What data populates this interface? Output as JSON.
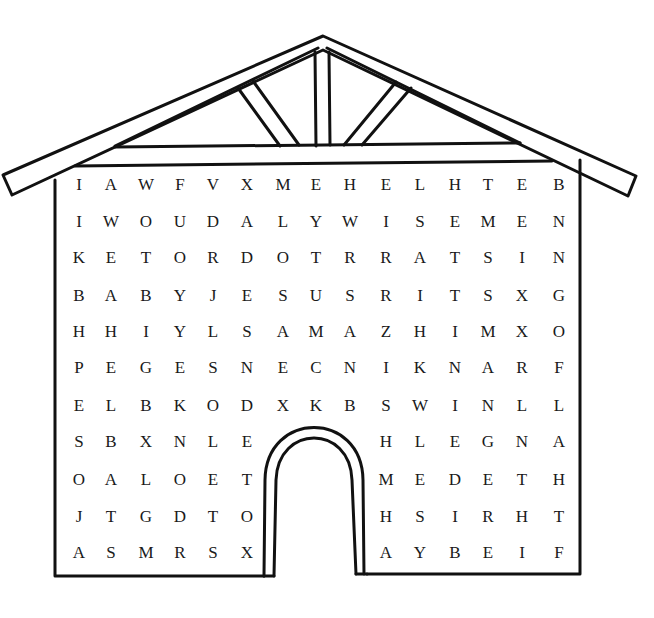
{
  "puzzle": {
    "type": "word-search",
    "shape": "house",
    "colors": {
      "line": "#111111",
      "background": "#ffffff",
      "letters": "#1a1a1a"
    },
    "columns": 15,
    "rows": 11,
    "door": {
      "rows": [
        7,
        10
      ],
      "cols": [
        6,
        10
      ],
      "note": "door opening blocks these cells"
    },
    "grid": [
      [
        "I",
        "A",
        "W",
        "F",
        "V",
        "X",
        "M",
        "E",
        "H",
        "E",
        "L",
        "H",
        "T",
        "E",
        "B"
      ],
      [
        "I",
        "W",
        "O",
        "U",
        "D",
        "A",
        "L",
        "Y",
        "W",
        "I",
        "S",
        "E",
        "M",
        "E",
        "N"
      ],
      [
        "K",
        "E",
        "T",
        "O",
        "R",
        "D",
        "O",
        "T",
        "R",
        "R",
        "A",
        "T",
        "S",
        "I",
        "N"
      ],
      [
        "B",
        "A",
        "B",
        "Y",
        "J",
        "E",
        "S",
        "U",
        "S",
        "R",
        "I",
        "T",
        "S",
        "X",
        "G"
      ],
      [
        "H",
        "H",
        "I",
        "Y",
        "L",
        "S",
        "A",
        "M",
        "A",
        "Z",
        "H",
        "I",
        "M",
        "X",
        "O"
      ],
      [
        "P",
        "E",
        "G",
        "E",
        "S",
        "N",
        "E",
        "C",
        "N",
        "I",
        "K",
        "N",
        "A",
        "R",
        "F"
      ],
      [
        "E",
        "L",
        "B",
        "K",
        "O",
        "D",
        "X",
        "K",
        "B",
        "S",
        "W",
        "I",
        "N",
        "L",
        "L"
      ],
      [
        "S",
        "B",
        "X",
        "N",
        "L",
        "E",
        "",
        "",
        "",
        "H",
        "L",
        "E",
        "G",
        "N",
        "A"
      ],
      [
        "O",
        "A",
        "L",
        "O",
        "E",
        "T",
        "",
        "",
        "",
        "M",
        "E",
        "D",
        "E",
        "T",
        "H"
      ],
      [
        "J",
        "T",
        "G",
        "D",
        "T",
        "O",
        "",
        "",
        "",
        "H",
        "S",
        "I",
        "R",
        "H",
        "T"
      ],
      [
        "A",
        "S",
        "M",
        "R",
        "S",
        "X",
        "",
        "",
        "",
        "A",
        "Y",
        "B",
        "E",
        "I",
        "F"
      ]
    ]
  }
}
